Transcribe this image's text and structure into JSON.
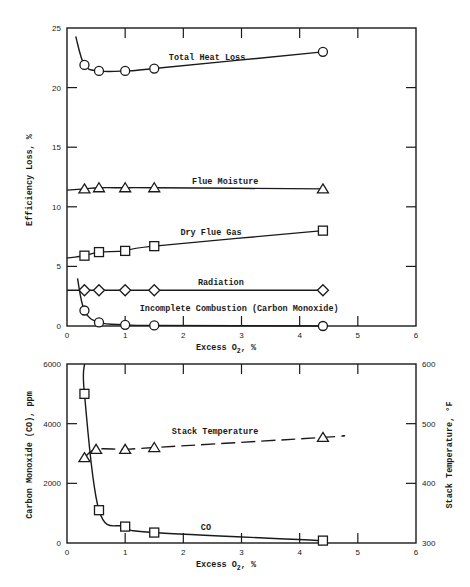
{
  "chart_data": [
    {
      "type": "line",
      "title": "",
      "xlabel": "Excess O2, %",
      "ylabel": "Efficiency Loss, %",
      "xlim": [
        0,
        6
      ],
      "ylim": [
        0,
        25
      ],
      "xticks": [
        "0",
        "1",
        "2",
        "3",
        "4",
        "5",
        "6"
      ],
      "yticks": [
        "0",
        "5",
        "10",
        "15",
        "20",
        "25"
      ],
      "grid": false,
      "series": [
        {
          "name": "Total Heat Loss",
          "marker": "circle",
          "x": [
            0.3,
            0.55,
            1.0,
            1.5,
            4.4
          ],
          "y": [
            21.9,
            21.4,
            21.4,
            21.6,
            23.0
          ],
          "curve_start": [
            0.15,
            24.3
          ]
        },
        {
          "name": "Flue Moisture",
          "marker": "triangle",
          "x": [
            0.3,
            0.55,
            1.0,
            1.5,
            4.4
          ],
          "y": [
            11.5,
            11.6,
            11.6,
            11.6,
            11.5
          ],
          "curve_start": [
            0.0,
            11.4
          ]
        },
        {
          "name": "Dry Flue Gas",
          "marker": "square",
          "x": [
            0.3,
            0.55,
            1.0,
            1.5,
            4.4
          ],
          "y": [
            5.9,
            6.2,
            6.3,
            6.7,
            8.0
          ],
          "curve_start": [
            0.0,
            5.7
          ]
        },
        {
          "name": "Radiation",
          "marker": "diamond",
          "x": [
            0.3,
            0.55,
            1.0,
            1.5,
            4.4
          ],
          "y": [
            3.0,
            3.0,
            3.0,
            3.0,
            3.0
          ],
          "curve_start": [
            0.0,
            3.0
          ]
        },
        {
          "name": "Incomplete Combustion (Carbon Monoxide)",
          "marker": "circle",
          "x": [
            0.3,
            0.55,
            1.0,
            1.5,
            4.4
          ],
          "y": [
            1.3,
            0.3,
            0.1,
            0.05,
            0.0
          ],
          "curve_start": [
            0.18,
            4.0
          ]
        }
      ],
      "labels": [
        {
          "text": "Total Heat Loss",
          "x": 1.75,
          "y": 22.3
        },
        {
          "text": "Flue Moisture",
          "x": 2.15,
          "y": 11.9
        },
        {
          "text": "Dry Flue Gas",
          "x": 1.95,
          "y": 7.6
        },
        {
          "text": "Radiation",
          "x": 2.25,
          "y": 3.4
        },
        {
          "text": "Incomplete Combustion (Carbon Monoxide)",
          "x": 1.25,
          "y": 1.3
        }
      ]
    },
    {
      "type": "line",
      "title": "",
      "xlabel": "Excess O2, %",
      "ylabel": "Carbon Monoxide (CO), ppm",
      "y2label": "Stack Temperature, °F",
      "xlim": [
        0,
        6
      ],
      "ylim": [
        0,
        6000
      ],
      "y2lim": [
        300,
        600
      ],
      "xticks": [
        "0",
        "1",
        "2",
        "3",
        "4",
        "5",
        "6"
      ],
      "yticks": [
        "0",
        "2000",
        "4000",
        "6000"
      ],
      "y2ticks": [
        "300",
        "400",
        "500",
        "600"
      ],
      "grid": false,
      "series": [
        {
          "name": "CO",
          "axis": "left",
          "marker": "square",
          "style": "solid",
          "x": [
            0.3,
            0.55,
            1.0,
            1.5,
            4.4
          ],
          "y": [
            5000,
            1100,
            550,
            350,
            80
          ],
          "curve_start": [
            0.3,
            6000
          ]
        },
        {
          "name": "Stack Temperature",
          "axis": "right",
          "marker": "triangle",
          "style": "dashed",
          "x": [
            0.3,
            0.5,
            1.0,
            1.5,
            4.4
          ],
          "y": [
            443,
            457,
            457,
            460,
            477
          ],
          "curve_end": [
            4.75,
            480
          ]
        }
      ],
      "labels": [
        {
          "text": "Stack Temperature",
          "x": 1.8,
          "y": 3650
        },
        {
          "text": "CO",
          "x": 2.3,
          "y": 430
        }
      ]
    }
  ],
  "top_chart": {
    "ylabel": "Efficiency Loss, %",
    "xlabel_main": "Excess O",
    "xlabel_sub": "2",
    "xlabel_tail": ", %"
  },
  "bottom_chart": {
    "ylabel": "Carbon Monoxide (CO), ppm",
    "y2label": "Stack Temperature, °F",
    "xlabel_main": "Excess O",
    "xlabel_sub": "2",
    "xlabel_tail": ", %"
  }
}
